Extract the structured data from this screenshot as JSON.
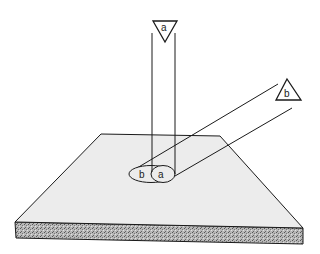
{
  "diagram": {
    "beams": [
      {
        "id": "a",
        "label": "a",
        "direction": "vertical",
        "footprint_label": "a"
      },
      {
        "id": "b",
        "label": "b",
        "direction": "oblique",
        "footprint_label": "b"
      }
    ],
    "colors": {
      "line": "#1a1a1a",
      "plate_top": "#ececec",
      "plate_edge": "#a9a9a9",
      "background": "#ffffff"
    }
  }
}
